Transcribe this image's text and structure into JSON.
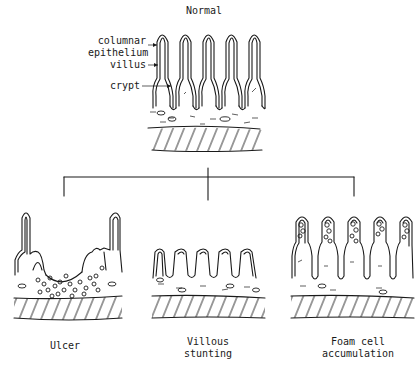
{
  "figure": {
    "type": "intestinal mucosa lesion schematic",
    "top_panel": {
      "title": "Normal",
      "annotations": [
        {
          "text": "columnar\nepithelium",
          "target": "villus tip epithelium"
        },
        {
          "text": "villus",
          "target": "villus body"
        },
        {
          "text": "crypt",
          "target": "crypt between villi"
        }
      ],
      "villus_count": 5
    },
    "connector": {
      "style": "bracket",
      "branches": 3
    },
    "bottom_panels": [
      {
        "id": "ulcer",
        "caption": "Ulcer"
      },
      {
        "id": "villous-stunting",
        "caption": "Villous\nstunting"
      },
      {
        "id": "foam-cell",
        "caption": "Foam cell\naccumulation"
      }
    ]
  },
  "colors": {
    "ink": "#1a1a1a",
    "background": "#ffffff"
  }
}
